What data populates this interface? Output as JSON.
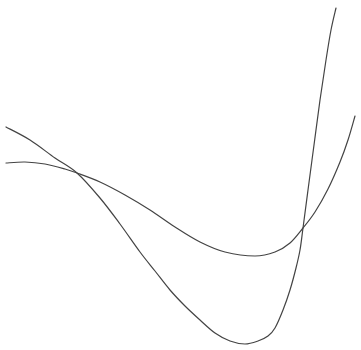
{
  "chart_data": {
    "type": "line",
    "title": "",
    "xlabel": "",
    "ylabel": "",
    "grid": false,
    "legend": null,
    "axes_visible": false,
    "line_color": "#444444",
    "background": "#ffffff",
    "series": [
      {
        "name": "quartic-curve",
        "description": "starts upper-left, descends steeply to a deep minimum near the bottom, then rises very steeply off the top edge",
        "points_px": [
          [
            6,
            127
          ],
          [
            30,
            140
          ],
          [
            55,
            158
          ],
          [
            77,
            173
          ],
          [
            100,
            198
          ],
          [
            120,
            224
          ],
          [
            140,
            252
          ],
          [
            155,
            271
          ],
          [
            170,
            290
          ],
          [
            185,
            306
          ],
          [
            200,
            320
          ],
          [
            215,
            333
          ],
          [
            230,
            341
          ],
          [
            245,
            344
          ],
          [
            258,
            341
          ],
          [
            268,
            336
          ],
          [
            275,
            328
          ],
          [
            283,
            310
          ],
          [
            290,
            290
          ],
          [
            296,
            268
          ],
          [
            300,
            250
          ],
          [
            303,
            228
          ],
          [
            308,
            190
          ],
          [
            314,
            145
          ],
          [
            320,
            100
          ],
          [
            326,
            60
          ],
          [
            331,
            30
          ],
          [
            336,
            8
          ]
        ]
      },
      {
        "name": "cubic-curve",
        "description": "starts middle-left, gently descends to a shallow minimum, then rises toward the right edge",
        "points_px": [
          [
            6,
            163
          ],
          [
            25,
            162
          ],
          [
            45,
            164
          ],
          [
            65,
            169
          ],
          [
            77,
            173
          ],
          [
            100,
            182
          ],
          [
            125,
            195
          ],
          [
            150,
            210
          ],
          [
            175,
            227
          ],
          [
            200,
            242
          ],
          [
            225,
            252
          ],
          [
            255,
            256
          ],
          [
            275,
            252
          ],
          [
            290,
            243
          ],
          [
            303,
            228
          ],
          [
            315,
            212
          ],
          [
            328,
            189
          ],
          [
            340,
            162
          ],
          [
            348,
            140
          ],
          [
            355,
            116
          ]
        ]
      }
    ],
    "intersections_px": [
      [
        77,
        173
      ],
      [
        303,
        228
      ]
    ]
  }
}
